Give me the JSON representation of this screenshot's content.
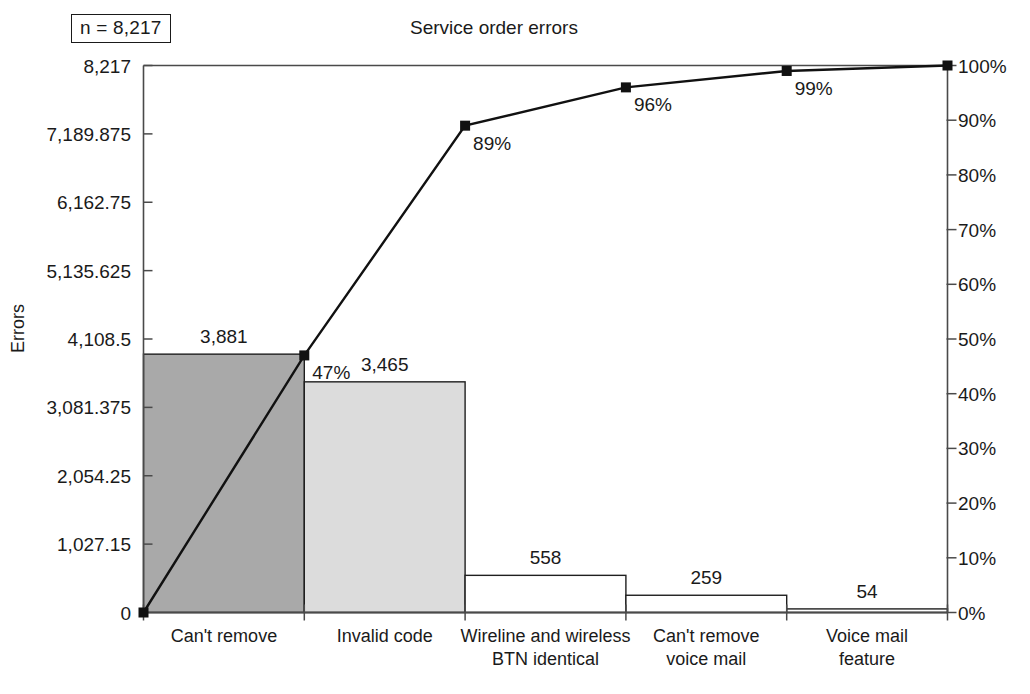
{
  "header": {
    "title": "Service order errors",
    "sample_size_label": "n = 8,217"
  },
  "chart_data": {
    "type": "bar",
    "title": "Service order errors",
    "subtitle": "",
    "xlabel": "",
    "ylabel": "Errors",
    "y2label": "",
    "grid": false,
    "legend_position": "none",
    "annotations": [
      "n = 8,217"
    ],
    "total": 8217,
    "categories": [
      "Can't remove",
      "Invalid code",
      "Wireline and wireless BTN identical",
      "Can't remove voice mail",
      "Voice mail feature"
    ],
    "category_lines": [
      [
        "Can't remove"
      ],
      [
        "Invalid code"
      ],
      [
        "Wireline and wireless",
        "BTN identical"
      ],
      [
        "Can't remove",
        "voice mail"
      ],
      [
        "Voice mail",
        "feature"
      ]
    ],
    "values": [
      3881,
      3465,
      558,
      259,
      54
    ],
    "value_labels": [
      "3,881",
      "3,465",
      "558",
      "259",
      "54"
    ],
    "bar_fills": [
      "#a9a9a9",
      "#dcdcdc",
      "#ffffff",
      "#ffffff",
      "#ffffff"
    ],
    "ylim": [
      0,
      8217
    ],
    "ytick_values": [
      0,
      1027.15,
      2054.25,
      3081.375,
      4108.5,
      5135.625,
      6162.75,
      7189.875,
      8217
    ],
    "ytick_labels": [
      "0",
      "1,027.15",
      "2,054.25",
      "3,081.375",
      "4,108.5",
      "5,135.625",
      "6,162.75",
      "7,189.875",
      "8,217"
    ],
    "cumulative_type": "line",
    "cumulative_percent": [
      47,
      89,
      96,
      99,
      100
    ],
    "cumulative_labels": [
      "47%",
      "89%",
      "96%",
      "99%"
    ],
    "cumulative_start_percent": 0,
    "y2lim": [
      0,
      100
    ],
    "y2tick_values": [
      0,
      10,
      20,
      30,
      40,
      50,
      60,
      70,
      80,
      90,
      100
    ],
    "y2tick_labels": [
      "0%",
      "10%",
      "20%",
      "30%",
      "40%",
      "50%",
      "60%",
      "70%",
      "80%",
      "90%",
      "100%"
    ],
    "marker": "square",
    "line_color": "#111111",
    "axis_color": "#4a4a4a"
  }
}
